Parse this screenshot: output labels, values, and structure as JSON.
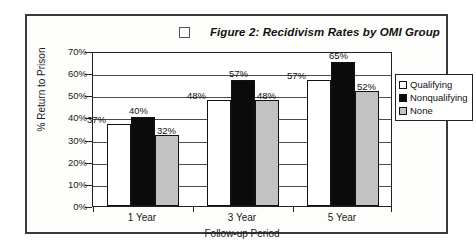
{
  "figure": {
    "checkbox_icon": "empty-checkbox-icon",
    "title": "Figure 2: Recidivism Rates by OMI Group"
  },
  "chart_data": {
    "type": "bar",
    "title": "Figure 2: Recidivism Rates by OMI Group",
    "xlabel": "Follow-up Period",
    "ylabel": "% Return to Prison",
    "categories": [
      "1 Year",
      "3 Year",
      "5 Year"
    ],
    "series": [
      {
        "name": "Qualifying",
        "color": "#ffffff",
        "values": [
          37,
          40,
          48
        ]
      },
      {
        "name": "Nonqualifying",
        "color": "#000000",
        "values": [
          40,
          57,
          65
        ]
      },
      {
        "name": "None",
        "color": "#c2c2c2",
        "values": [
          32,
          48,
          52
        ]
      }
    ],
    "series_fixed": [
      {
        "name": "Qualifying",
        "values": [
          37,
          48,
          57
        ]
      },
      {
        "name": "Nonqualifying",
        "values": [
          40,
          57,
          65
        ]
      },
      {
        "name": "None",
        "values": [
          32,
          48,
          52
        ]
      }
    ],
    "value_labels": [
      "37%",
      "40%",
      "32%",
      "48%",
      "57%",
      "48%",
      "57%",
      "65%",
      "52%"
    ],
    "ylim": [
      0,
      70
    ],
    "yticks": [
      "0%",
      "10%",
      "20%",
      "30%",
      "40%",
      "50%",
      "60%",
      "70%"
    ],
    "ytick_values": [
      0,
      10,
      20,
      30,
      40,
      50,
      60,
      70
    ],
    "grid": true,
    "legend_position": "right"
  },
  "legend": {
    "items": [
      {
        "label": "Qualifying"
      },
      {
        "label": "Nonqualifying"
      },
      {
        "label": "None"
      }
    ]
  }
}
